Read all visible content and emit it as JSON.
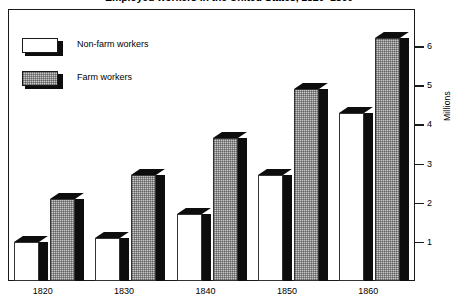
{
  "chart_data": {
    "type": "bar",
    "title": "Employed workers in the United States, 1820–1860",
    "xlabel": "",
    "ylabel": "Millions",
    "categories": [
      "1820",
      "1830",
      "1840",
      "1850",
      "1860"
    ],
    "series": [
      {
        "name": "Non-farm workers",
        "fill": "white",
        "values": [
          1.0,
          1.1,
          1.7,
          2.7,
          4.3
        ]
      },
      {
        "name": "Farm workers",
        "fill": "gray-stipple",
        "values": [
          2.1,
          2.7,
          3.65,
          4.9,
          6.2
        ]
      }
    ],
    "ylim": [
      0,
      6.95
    ],
    "yticks": [
      1,
      2,
      3,
      4,
      5,
      6
    ],
    "ytick_labels": [
      "1",
      "2",
      "3",
      "4",
      "5",
      "6"
    ],
    "grid": false,
    "legend_position": "top-left",
    "axis_side": "right",
    "style": "3d-shadow-bars"
  },
  "legend": {
    "items": [
      {
        "label": "Non-farm workers",
        "swatch": "white-bar-swatch"
      },
      {
        "label": "Farm workers",
        "swatch": "gray-bar-swatch"
      }
    ]
  },
  "colors": {
    "frame": "#1a1a1a",
    "bar_outline": "#333333",
    "bar_shadow": "#0d0d0d",
    "farm_fill": "#c9c9c9",
    "nonfarm_fill": "#ffffff",
    "background": "#ffffff",
    "text": "#000000"
  }
}
